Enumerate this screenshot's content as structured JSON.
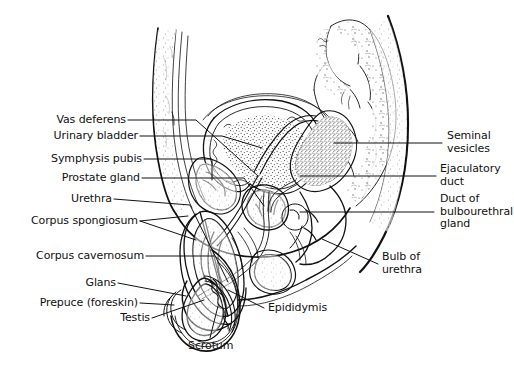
{
  "figure": {
    "background_color": "#ffffff",
    "ink_color": "#111111",
    "width": 514,
    "height": 366
  },
  "labels": {
    "vas_deferens": "Vas deferens",
    "urinary_bladder": "Urinary bladder",
    "symphysis_pubis": "Symphysis pubis",
    "prostate_gland": "Prostate gland",
    "urethra": "Urethra",
    "corpus_spongiosum": "Corpus spongiosum",
    "corpus_cavernosum": "Corpus cavernosum",
    "glans": "Glans",
    "prepuce": "Prepuce (foreskin)",
    "testis": "Testis",
    "scrotum": "Scrotum",
    "epididymis": "Epididymis",
    "seminal_vesicles_line1": "Seminal",
    "seminal_vesicles_line2": "vesicles",
    "ejaculatory_duct_line1": "Ejaculatory",
    "ejaculatory_duct_line2": "duct",
    "bulbourethral_line1": "Duct of",
    "bulbourethral_line2": "bulbourethral",
    "bulbourethral_line3": "gland",
    "bulb_of_urethra_line1": "Bulb of",
    "bulb_of_urethra_line2": "urethra"
  }
}
